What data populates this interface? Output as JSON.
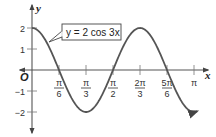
{
  "chart_data": {
    "type": "line",
    "title": "",
    "annotation": "y = 2 cos 3x",
    "xlabel": "x",
    "ylabel": "y",
    "origin_label": "O",
    "function": "y = 2 cos(3x)",
    "xlim": [
      0,
      3.14159
    ],
    "ylim": [
      -2,
      2
    ],
    "grid": false,
    "x_ticks": [
      {
        "value": 0.5236,
        "label_num": "π",
        "label_den": "6"
      },
      {
        "value": 1.0472,
        "label_num": "π",
        "label_den": "3"
      },
      {
        "value": 1.5708,
        "label_num": "π",
        "label_den": "2"
      },
      {
        "value": 2.0944,
        "label_num": "2π",
        "label_den": "3"
      },
      {
        "value": 2.618,
        "label_num": "5π",
        "label_den": "6"
      },
      {
        "value": 3.1416,
        "label_num": "π",
        "label_den": ""
      }
    ],
    "y_ticks": [
      {
        "value": 2,
        "label": "2"
      },
      {
        "value": 1,
        "label": "1"
      },
      {
        "value": -1,
        "label": "−1"
      },
      {
        "value": -2,
        "label": "−2"
      }
    ],
    "series": [
      {
        "name": "y = 2 cos 3x",
        "x": [
          0,
          0.5236,
          1.0472,
          1.5708,
          2.0944,
          2.618,
          3.1416
        ],
        "y": [
          2,
          0,
          -2,
          0,
          2,
          0,
          -2
        ]
      }
    ],
    "colors": {
      "curve": "#555555",
      "axis": "#444444"
    }
  }
}
